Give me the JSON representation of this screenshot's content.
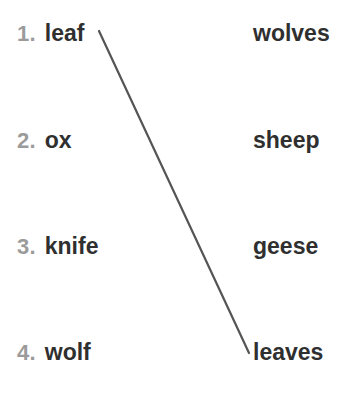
{
  "exercise": {
    "background_color": "#ffffff",
    "number_color": "#9b9b9b",
    "word_color": "#2f2f2f",
    "line_color": "#555555",
    "rows": [
      {
        "number": "1.",
        "singular": "leaf",
        "plural": "wolves",
        "top": 18
      },
      {
        "number": "2.",
        "singular": "ox",
        "plural": "sheep",
        "top": 125
      },
      {
        "number": "3.",
        "singular": "knife",
        "plural": "geese",
        "top": 231
      },
      {
        "number": "4.",
        "singular": "wolf",
        "plural": "leaves",
        "top": 337
      }
    ],
    "connections": [
      {
        "from_label": "leaf",
        "to_label": "leaves",
        "x1": 99,
        "y1": 31,
        "x2": 249,
        "y2": 353,
        "stroke_width": 2.2
      }
    ]
  }
}
